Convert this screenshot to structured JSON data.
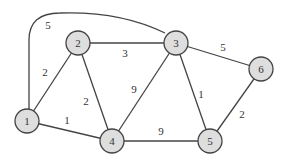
{
  "graph": {
    "nodes": [
      {
        "id": "1",
        "label": "1",
        "x": 27,
        "y": 121
      },
      {
        "id": "2",
        "label": "2",
        "x": 78,
        "y": 43
      },
      {
        "id": "3",
        "label": "3",
        "x": 176,
        "y": 43
      },
      {
        "id": "4",
        "label": "4",
        "x": 112,
        "y": 141
      },
      {
        "id": "5",
        "label": "5",
        "x": 210,
        "y": 141
      },
      {
        "id": "6",
        "label": "6",
        "x": 261,
        "y": 69
      }
    ],
    "edges": [
      {
        "from": "1",
        "to": "2",
        "weight": "2"
      },
      {
        "from": "1",
        "to": "3",
        "weight": "5",
        "curved": true
      },
      {
        "from": "1",
        "to": "4",
        "weight": "1"
      },
      {
        "from": "2",
        "to": "3",
        "weight": "3"
      },
      {
        "from": "2",
        "to": "4",
        "weight": "2"
      },
      {
        "from": "3",
        "to": "4",
        "weight": "9"
      },
      {
        "from": "3",
        "to": "5",
        "weight": "1"
      },
      {
        "from": "3",
        "to": "6",
        "weight": "5"
      },
      {
        "from": "4",
        "to": "5",
        "weight": "9"
      },
      {
        "from": "5",
        "to": "6",
        "weight": "2"
      }
    ]
  }
}
